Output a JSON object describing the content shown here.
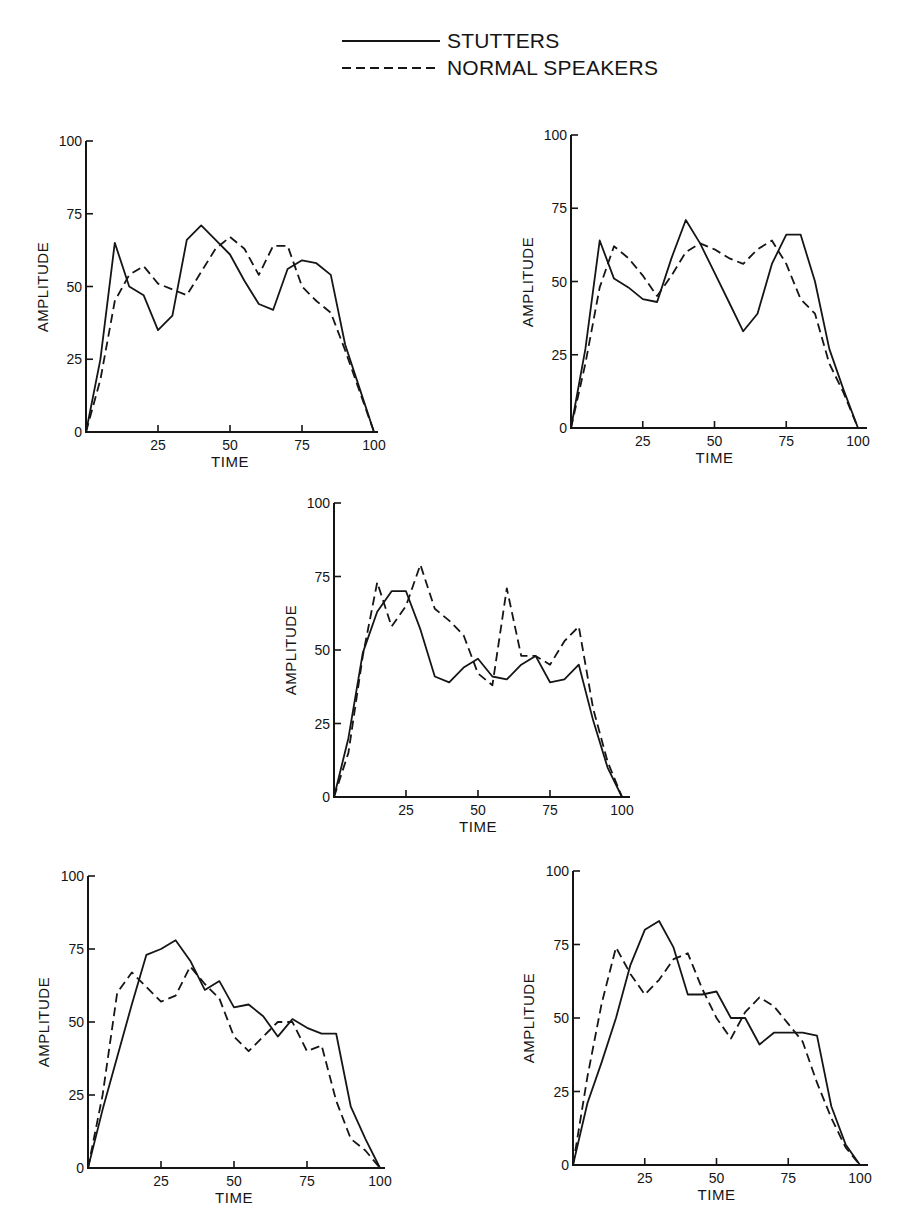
{
  "legend": {
    "items": [
      {
        "label": "STUTTERS",
        "style": "solid"
      },
      {
        "label": "NORMAL SPEAKERS",
        "style": "dashed"
      }
    ]
  },
  "colors": {
    "ink": "#151515",
    "background": "#ffffff"
  },
  "chart_data": [
    {
      "type": "line",
      "panel": "top-left",
      "title": "",
      "xlabel": "TIME",
      "ylabel": "AMPLITUDE",
      "xlim": [
        0,
        100
      ],
      "ylim": [
        0,
        100
      ],
      "xticks": [
        0,
        25,
        50,
        75,
        100
      ],
      "yticks": [
        0,
        25,
        50,
        75,
        100
      ],
      "grid": false,
      "series": [
        {
          "name": "STUTTERS",
          "style": "solid",
          "x": [
            0,
            5,
            10,
            15,
            20,
            25,
            30,
            35,
            40,
            45,
            50,
            55,
            60,
            65,
            70,
            75,
            80,
            85,
            90,
            95,
            100
          ],
          "values": [
            0,
            25,
            65,
            50,
            47,
            35,
            40,
            66,
            71,
            66,
            61,
            52,
            44,
            42,
            56,
            59,
            58,
            54,
            30,
            15,
            0
          ]
        },
        {
          "name": "NORMAL SPEAKERS",
          "style": "dashed",
          "x": [
            0,
            5,
            10,
            15,
            20,
            25,
            30,
            35,
            40,
            45,
            50,
            55,
            60,
            65,
            70,
            75,
            80,
            85,
            90,
            95,
            100
          ],
          "values": [
            0,
            18,
            45,
            54,
            57,
            51,
            49,
            47,
            55,
            63,
            67,
            63,
            54,
            64,
            64,
            50,
            45,
            41,
            28,
            14,
            0
          ]
        }
      ]
    },
    {
      "type": "line",
      "panel": "top-right",
      "title": "",
      "xlabel": "TIME",
      "ylabel": "AMPLITUDE",
      "xlim": [
        0,
        100
      ],
      "ylim": [
        0,
        100
      ],
      "xticks": [
        0,
        25,
        50,
        75,
        100
      ],
      "yticks": [
        0,
        25,
        50,
        75,
        100
      ],
      "grid": false,
      "series": [
        {
          "name": "STUTTERS",
          "style": "solid",
          "x": [
            0,
            5,
            10,
            15,
            20,
            25,
            30,
            35,
            40,
            45,
            50,
            55,
            60,
            65,
            70,
            75,
            80,
            85,
            90,
            95,
            100
          ],
          "values": [
            0,
            27,
            64,
            51,
            48,
            44,
            43,
            58,
            71,
            63,
            53,
            43,
            33,
            39,
            56,
            66,
            66,
            50,
            27,
            13,
            0
          ]
        },
        {
          "name": "NORMAL SPEAKERS",
          "style": "dashed",
          "x": [
            0,
            5,
            10,
            15,
            20,
            25,
            30,
            35,
            40,
            45,
            50,
            55,
            60,
            65,
            70,
            75,
            80,
            85,
            90,
            95,
            100
          ],
          "values": [
            0,
            22,
            48,
            62,
            58,
            52,
            45,
            52,
            60,
            63,
            61,
            58,
            56,
            61,
            64,
            56,
            44,
            39,
            22,
            12,
            0
          ]
        }
      ]
    },
    {
      "type": "line",
      "panel": "middle",
      "title": "",
      "xlabel": "TIME",
      "ylabel": "AMPLITUDE",
      "xlim": [
        0,
        100
      ],
      "ylim": [
        0,
        100
      ],
      "xticks": [
        0,
        25,
        50,
        75,
        100
      ],
      "yticks": [
        0,
        25,
        50,
        75,
        100
      ],
      "grid": false,
      "series": [
        {
          "name": "STUTTERS",
          "style": "solid",
          "x": [
            0,
            5,
            10,
            15,
            20,
            25,
            30,
            35,
            40,
            45,
            50,
            55,
            60,
            65,
            70,
            75,
            80,
            85,
            90,
            95,
            100
          ],
          "values": [
            0,
            20,
            49,
            63,
            70,
            70,
            57,
            41,
            39,
            44,
            47,
            41,
            40,
            45,
            48,
            39,
            40,
            45,
            26,
            10,
            0
          ]
        },
        {
          "name": "NORMAL SPEAKERS",
          "style": "dashed",
          "x": [
            0,
            5,
            10,
            15,
            20,
            25,
            30,
            35,
            40,
            45,
            50,
            55,
            60,
            65,
            70,
            75,
            80,
            85,
            90,
            95,
            100
          ],
          "values": [
            0,
            15,
            48,
            73,
            58,
            65,
            79,
            64,
            60,
            55,
            42,
            38,
            71,
            48,
            48,
            45,
            53,
            58,
            30,
            12,
            0
          ]
        }
      ]
    },
    {
      "type": "line",
      "panel": "bottom-left",
      "title": "",
      "xlabel": "TIME",
      "ylabel": "AMPLITUDE",
      "xlim": [
        0,
        100
      ],
      "ylim": [
        0,
        100
      ],
      "xticks": [
        0,
        25,
        50,
        75,
        100
      ],
      "yticks": [
        0,
        25,
        50,
        75,
        100
      ],
      "grid": false,
      "series": [
        {
          "name": "STUTTERS",
          "style": "solid",
          "x": [
            0,
            5,
            10,
            15,
            20,
            25,
            30,
            35,
            40,
            45,
            50,
            55,
            60,
            65,
            70,
            75,
            80,
            85,
            90,
            95,
            100
          ],
          "values": [
            0,
            20,
            38,
            56,
            73,
            75,
            78,
            71,
            61,
            64,
            55,
            56,
            52,
            45,
            51,
            48,
            46,
            46,
            21,
            10,
            0
          ]
        },
        {
          "name": "NORMAL SPEAKERS",
          "style": "dashed",
          "x": [
            0,
            5,
            10,
            15,
            20,
            25,
            30,
            35,
            40,
            45,
            50,
            55,
            60,
            65,
            70,
            75,
            80,
            85,
            90,
            95,
            100
          ],
          "values": [
            0,
            25,
            60,
            67,
            62,
            57,
            59,
            69,
            63,
            58,
            45,
            40,
            45,
            50,
            50,
            40,
            42,
            23,
            10,
            6,
            0
          ]
        }
      ]
    },
    {
      "type": "line",
      "panel": "bottom-right",
      "title": "",
      "xlabel": "TIME",
      "ylabel": "AMPLITUDE",
      "xlim": [
        0,
        100
      ],
      "ylim": [
        0,
        100
      ],
      "xticks": [
        0,
        25,
        50,
        75,
        100
      ],
      "yticks": [
        0,
        25,
        50,
        75,
        100
      ],
      "grid": false,
      "series": [
        {
          "name": "STUTTERS",
          "style": "solid",
          "x": [
            0,
            5,
            10,
            15,
            20,
            25,
            30,
            35,
            40,
            45,
            50,
            55,
            60,
            65,
            70,
            75,
            80,
            85,
            90,
            95,
            100
          ],
          "values": [
            0,
            21,
            35,
            50,
            68,
            80,
            83,
            74,
            58,
            58,
            59,
            50,
            50,
            41,
            45,
            45,
            45,
            44,
            20,
            7,
            0
          ]
        },
        {
          "name": "NORMAL SPEAKERS",
          "style": "dashed",
          "x": [
            0,
            5,
            10,
            15,
            20,
            25,
            30,
            35,
            40,
            45,
            50,
            55,
            60,
            65,
            70,
            75,
            80,
            85,
            90,
            95,
            100
          ],
          "values": [
            0,
            30,
            55,
            74,
            65,
            58,
            63,
            70,
            72,
            60,
            50,
            43,
            52,
            57,
            54,
            48,
            42,
            28,
            16,
            6,
            0
          ]
        }
      ]
    }
  ],
  "panels_layout": [
    {
      "x0": 86,
      "x1": 374,
      "y0": 432,
      "y1": 141,
      "ylabel_x": 48,
      "ylabel_y": 287,
      "tick_x_end": 378
    },
    {
      "x0": 571,
      "x1": 858,
      "y0": 428,
      "y1": 135,
      "ylabel_x": 533,
      "ylabel_y": 282,
      "tick_x_end": 867
    },
    {
      "x0": 334,
      "x1": 622,
      "y0": 797,
      "y1": 503,
      "ylabel_x": 296,
      "ylabel_y": 650,
      "tick_x_end": 630
    },
    {
      "x0": 88,
      "x1": 380,
      "y0": 1168,
      "y1": 876,
      "ylabel_x": 49,
      "ylabel_y": 1022,
      "tick_x_end": 385
    },
    {
      "x0": 573,
      "x1": 860,
      "y0": 1165,
      "y1": 871,
      "ylabel_x": 534,
      "ylabel_y": 1018,
      "tick_x_end": 868
    }
  ]
}
